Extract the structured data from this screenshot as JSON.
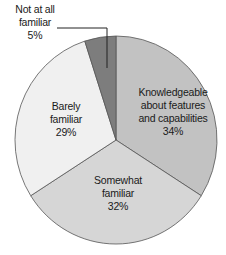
{
  "chart_data": {
    "type": "pie",
    "title": "",
    "start_angle_deg": 0,
    "direction": "clockwise",
    "slices": [
      {
        "label": "Knowledgeable about features and capabilities",
        "label_lines": [
          "Knowledgeable",
          "about features",
          "and capabilities"
        ],
        "value": 34,
        "pct_text": "34%",
        "color": "#c2c2c2"
      },
      {
        "label": "Somewhat familiar",
        "label_lines": [
          "Somewhat",
          "familiar"
        ],
        "value": 32,
        "pct_text": "32%",
        "color": "#d6d6d6"
      },
      {
        "label": "Barely familiar",
        "label_lines": [
          "Barely",
          "familiar"
        ],
        "value": 29,
        "pct_text": "29%",
        "color": "#f0f0f0"
      },
      {
        "label": "Not at all familiar",
        "label_lines": [
          "Not at all",
          "familiar"
        ],
        "value": 5,
        "pct_text": "5%",
        "color": "#7d7d7d"
      }
    ],
    "legend": "none (direct labels)",
    "callout": {
      "slice": "Not at all familiar",
      "leader_line": true
    }
  }
}
